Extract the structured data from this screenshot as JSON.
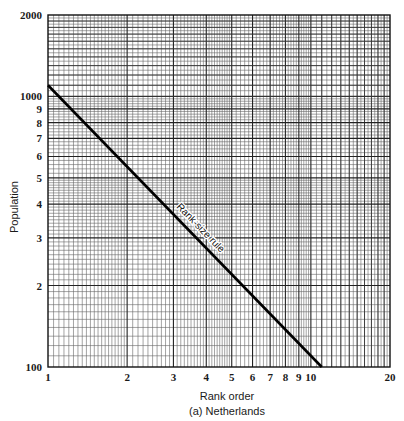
{
  "chart_data": {
    "type": "line",
    "title": "",
    "caption": "(a) Netherlands",
    "xlabel": "Rank order",
    "ylabel": "Population",
    "xscale": "log",
    "yscale": "log",
    "xlim": [
      1,
      20
    ],
    "ylim": [
      100,
      2000
    ],
    "grid": true,
    "x_ticks": [
      {
        "value": 1,
        "label": "1"
      },
      {
        "value": 2,
        "label": "2"
      },
      {
        "value": 3,
        "label": "3"
      },
      {
        "value": 4,
        "label": "4"
      },
      {
        "value": 5,
        "label": "5"
      },
      {
        "value": 6,
        "label": "6"
      },
      {
        "value": 7,
        "label": "7"
      },
      {
        "value": 8,
        "label": "8"
      },
      {
        "value": 9,
        "label": "9"
      },
      {
        "value": 10,
        "label": "10"
      },
      {
        "value": 20,
        "label": "20"
      }
    ],
    "y_ticks": [
      {
        "value": 100,
        "label": "100"
      },
      {
        "value": 200,
        "label": "2"
      },
      {
        "value": 300,
        "label": "3"
      },
      {
        "value": 400,
        "label": "4"
      },
      {
        "value": 500,
        "label": "5"
      },
      {
        "value": 600,
        "label": "6"
      },
      {
        "value": 700,
        "label": "7"
      },
      {
        "value": 800,
        "label": "8"
      },
      {
        "value": 900,
        "label": "9"
      },
      {
        "value": 1000,
        "label": "1000"
      },
      {
        "value": 2000,
        "label": "2000"
      }
    ],
    "series": [
      {
        "name": "Rank-size rule",
        "points": [
          {
            "x": 1,
            "y": 1100
          },
          {
            "x": 11,
            "y": 100
          }
        ]
      }
    ],
    "annotations": [
      {
        "text": "Rank-size rule",
        "x": 3.6,
        "y": 310,
        "along_series": "Rank-size rule"
      }
    ]
  }
}
